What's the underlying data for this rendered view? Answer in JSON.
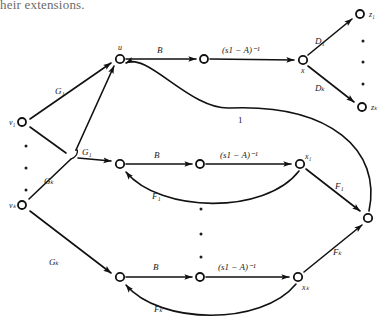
{
  "caption": {
    "text": "heir extensions."
  },
  "diagram": {
    "type": "signal-flow-graph",
    "stroke_color": "#111111",
    "node_fill": "#ffffff",
    "text_color": "#1a1a1a",
    "nodes": [
      {
        "id": "v1",
        "label": "v₁",
        "x": 22,
        "y": 122,
        "label_dx": -13,
        "label_dy": 3
      },
      {
        "id": "vk",
        "label": "vₖ",
        "x": 22,
        "y": 205,
        "label_dx": -13,
        "label_dy": 3
      },
      {
        "id": "u",
        "label": "u",
        "x": 120,
        "y": 59,
        "label_dx": -2,
        "label_dy": -7
      },
      {
        "id": "n1",
        "label": "",
        "x": 204,
        "y": 59,
        "label_dx": 0,
        "label_dy": 0
      },
      {
        "id": "x",
        "label": "x",
        "x": 303,
        "y": 60,
        "label_dx": 0,
        "label_dy": 12
      },
      {
        "id": "z1",
        "label": "z₁",
        "x": 360,
        "y": 14,
        "label_dx": 9,
        "label_dy": 3
      },
      {
        "id": "zk",
        "label": "zₖ",
        "x": 362,
        "y": 107,
        "label_dx": 9,
        "label_dy": 3
      },
      {
        "id": "m1",
        "label": "",
        "x": 120,
        "y": 164,
        "label_dx": 0,
        "label_dy": 0
      },
      {
        "id": "m2",
        "label": "",
        "x": 200,
        "y": 164,
        "label_dx": 0,
        "label_dy": 0
      },
      {
        "id": "x1",
        "label": "x₁",
        "x": 300,
        "y": 164,
        "label_dx": 8,
        "label_dy": -5
      },
      {
        "id": "b1",
        "label": "",
        "x": 120,
        "y": 277,
        "label_dx": 0,
        "label_dy": 0
      },
      {
        "id": "b2",
        "label": "",
        "x": 200,
        "y": 277,
        "label_dx": 0,
        "label_dy": 0
      },
      {
        "id": "xk",
        "label": "xₖ",
        "x": 298,
        "y": 277,
        "label_dx": 6,
        "label_dy": 13
      },
      {
        "id": "sum",
        "label": "",
        "x": 368,
        "y": 218,
        "label_dx": 0,
        "label_dy": 0
      }
    ],
    "edge_labels": [
      {
        "id": "g1-top",
        "text": "G₁",
        "x": 62,
        "y": 91,
        "style": "italic"
      },
      {
        "id": "g1-mid",
        "text": "G₁",
        "x": 89,
        "y": 152,
        "style": "italic"
      },
      {
        "id": "gk-mid",
        "text": "Gₖ",
        "x": 51,
        "y": 181,
        "style": "italic"
      },
      {
        "id": "gk-bot",
        "text": "Gₖ",
        "x": 56,
        "y": 262,
        "style": "italic"
      },
      {
        "id": "b-top",
        "text": "B",
        "x": 159,
        "y": 52,
        "style": "italic"
      },
      {
        "id": "b-mid",
        "text": "B",
        "x": 156,
        "y": 157,
        "style": "italic"
      },
      {
        "id": "b-bot",
        "text": "B",
        "x": 155,
        "y": 269,
        "style": "italic"
      },
      {
        "id": "res-top",
        "text": "(s1 − A)⁻¹",
        "x": 252,
        "y": 52,
        "style": "italic"
      },
      {
        "id": "res-mid",
        "text": "(s1 − A)⁻¹",
        "x": 250,
        "y": 157,
        "style": "italic"
      },
      {
        "id": "res-bot",
        "text": "(s1 − A)⁻¹",
        "x": 248,
        "y": 269,
        "style": "italic"
      },
      {
        "id": "d1",
        "text": "D₁",
        "x": 320,
        "y": 41,
        "style": "italic"
      },
      {
        "id": "dk",
        "text": "Dₖ",
        "x": 320,
        "y": 88,
        "style": "italic"
      },
      {
        "id": "one",
        "text": "1",
        "x": 240,
        "y": 120,
        "style": "upright"
      },
      {
        "id": "f1-fb",
        "text": "F₁",
        "x": 158,
        "y": 196,
        "style": "italic"
      },
      {
        "id": "fk-fb",
        "text": "Fₖ",
        "x": 160,
        "y": 309,
        "style": "italic"
      },
      {
        "id": "f1-r",
        "text": "F₁",
        "x": 340,
        "y": 186,
        "style": "italic"
      },
      {
        "id": "fk-r",
        "text": "Fₖ",
        "x": 338,
        "y": 252,
        "style": "italic"
      }
    ],
    "ellipses": [
      {
        "id": "left-dots",
        "orientation": "vertical",
        "x": 26,
        "points_y": [
          146,
          168,
          190
        ]
      },
      {
        "id": "mid-dots",
        "orientation": "vertical",
        "x": 201,
        "points_y": [
          209,
          234,
          257
        ]
      },
      {
        "id": "right-dots",
        "orientation": "vertical",
        "x": 363,
        "points_y": [
          41,
          62,
          84
        ]
      }
    ]
  }
}
